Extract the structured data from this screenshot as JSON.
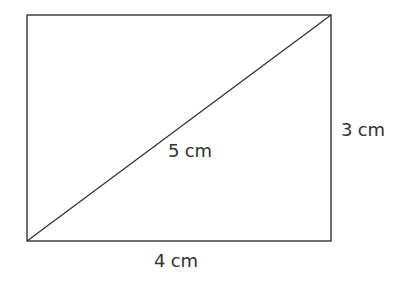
{
  "figure": {
    "type": "rectangle-with-diagonal",
    "rectangle": {
      "x1": 27,
      "y1": 15,
      "x2": 331,
      "y2": 241
    },
    "diagonal": {
      "from": [
        27,
        241
      ],
      "to": [
        331,
        15
      ]
    },
    "stroke_color": "#333333",
    "background_color": "#ffffff"
  },
  "labels": {
    "diagonal": "5 cm",
    "height": "3 cm",
    "width": "4 cm"
  }
}
